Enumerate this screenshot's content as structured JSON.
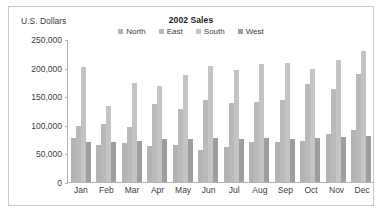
{
  "chart_data": {
    "type": "bar",
    "title": "2002 Sales",
    "xlabel": "",
    "ylabel": "U.S. Dollars",
    "ylim": [
      0,
      250000
    ],
    "yticks": [
      0,
      50000,
      100000,
      150000,
      200000,
      250000
    ],
    "ytick_labels": [
      "0",
      "50,000",
      "100,000",
      "150,000",
      "200,000",
      "250,000"
    ],
    "grid": false,
    "legend_position": "top-center",
    "categories": [
      "Jan",
      "Feb",
      "Mar",
      "Apr",
      "May",
      "Jun",
      "Jul",
      "Aug",
      "Sep",
      "Oct",
      "Nov",
      "Dec"
    ],
    "series": [
      {
        "name": "North",
        "color": "#b3b3b3",
        "values": [
          78000,
          66000,
          68000,
          64000,
          65000,
          57000,
          62000,
          71000,
          71000,
          72000,
          84000,
          91000
        ]
      },
      {
        "name": "East",
        "color": "#b9b9b9",
        "values": [
          99000,
          102000,
          97000,
          138000,
          129000,
          144000,
          139000,
          141000,
          145000,
          173000,
          164000,
          190000
        ]
      },
      {
        "name": "South",
        "color": "#c4c4c4",
        "values": [
          203000,
          134000,
          175000,
          169000,
          188000,
          204000,
          198000,
          207000,
          210000,
          199000,
          215000,
          230000
        ]
      },
      {
        "name": "West",
        "color": "#9e9e9e",
        "values": [
          71000,
          71000,
          72000,
          75000,
          76000,
          77000,
          75000,
          77000,
          76000,
          78000,
          80000,
          81000
        ]
      }
    ]
  },
  "colors": {
    "frame_border": "#c9c9c9",
    "axis": "#b5b5b5",
    "text": "#3d3d3d",
    "title_text": "#1c1c1c",
    "background": "#ffffff"
  }
}
